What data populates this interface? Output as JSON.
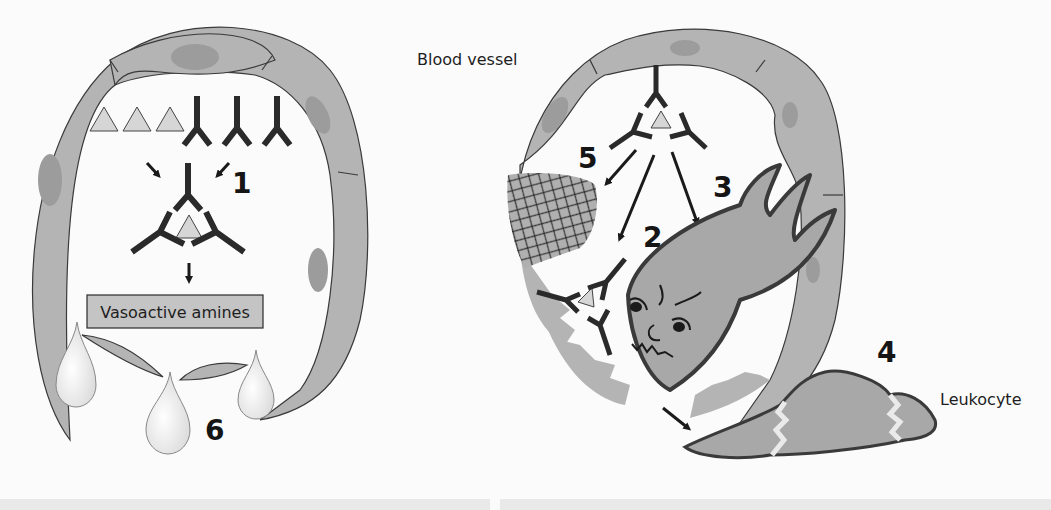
{
  "labels": {
    "blood_vessel": "Blood vessel",
    "vasoactive_amines": "Vasoactive amines",
    "leukocyte": "Leukocyte"
  },
  "step_numbers": {
    "s1": "1",
    "s2": "2",
    "s3": "3",
    "s4": "4",
    "s5": "5",
    "s6": "6"
  },
  "colors": {
    "background": "#fbfbfb",
    "vessel_wall": "#b4b4b4",
    "nucleus": "#9c9c9c",
    "outline": "#3a3a3a",
    "antibody": "#2a2a2a",
    "antigen": "#d6d6d6",
    "cell_body": "#a8a8a8",
    "amine_box": "#c4c4c4",
    "droplet": "#ececec"
  }
}
